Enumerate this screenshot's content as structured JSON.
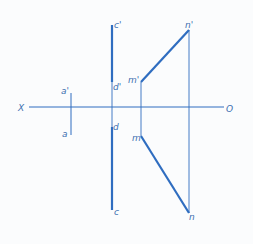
{
  "diagram": {
    "type": "orthographic-projection",
    "colors": {
      "line": "#2f6dc0",
      "label": "#3b6fb0",
      "background": "#fbfcfd"
    },
    "axis": {
      "left_label": "X",
      "right_label": "O"
    },
    "labels": {
      "a_prime": "a'",
      "a": "a",
      "c_prime": "c'",
      "d_prime": "d'",
      "d": "d",
      "c": "c",
      "m_prime": "m'",
      "n_prime": "n'",
      "m": "m",
      "n": "n"
    }
  }
}
